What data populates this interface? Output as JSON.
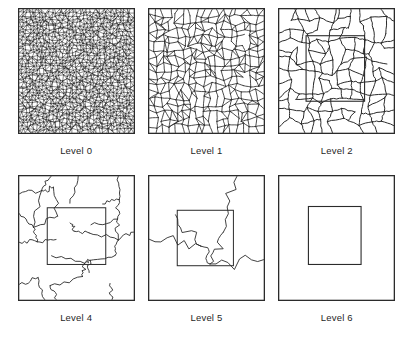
{
  "figure": {
    "type": "multilevel-mesh-coarsening-diagram",
    "background_color": "#ffffff",
    "line_color": "#2b2b2b",
    "label_color": "#1f1f1f",
    "rows": 2,
    "columns": 3,
    "panel_count": 6
  },
  "panels": [
    {
      "id": "level-0",
      "label": "Level 0",
      "row": 0,
      "column": 0,
      "density": 34,
      "jitter": 0.42,
      "edge_width": 0.55,
      "border_width": 1.3,
      "wobble": 0.0,
      "wobble_segments": 1,
      "inner_rect": null,
      "seed": 10701,
      "description": "very dense fine triangular polygonal mesh filling the square"
    },
    {
      "id": "level-1",
      "label": "Level 1",
      "row": 0,
      "column": 1,
      "density": 17,
      "jitter": 0.4,
      "edge_width": 0.85,
      "border_width": 1.3,
      "wobble": 0.035,
      "wobble_segments": 3,
      "inner_rect": null,
      "seed": 22413,
      "description": "medium density polygonal cells, roughly four times coarser than level 0"
    },
    {
      "id": "level-2",
      "label": "Level 2",
      "row": 0,
      "column": 2,
      "density": 11,
      "jitter": 0.46,
      "edge_width": 1.0,
      "border_width": 1.3,
      "wobble": 0.07,
      "wobble_segments": 4,
      "inner_rect": {
        "x": 0.24,
        "y": 0.22,
        "w": 0.5,
        "h": 0.52,
        "width": 1.1
      },
      "seed": 33157,
      "description": "coarse polygonal cells with a faint interior rectangle region outline"
    },
    {
      "id": "level-4",
      "label": "Level 4",
      "row": 1,
      "column": 0,
      "density": 6,
      "jitter": 0.5,
      "edge_width": 0.9,
      "border_width": 1.3,
      "wobble": 0.16,
      "wobble_segments": 7,
      "inner_rect": {
        "x": 0.25,
        "y": 0.26,
        "w": 0.5,
        "h": 0.45,
        "width": 1.0
      },
      "seed": 44029,
      "description": "few large wiggly regions with an interior rectangle outline"
    },
    {
      "id": "level-5",
      "label": "Level 5",
      "row": 1,
      "column": 1,
      "density": 3,
      "jitter": 0.44,
      "edge_width": 0.9,
      "border_width": 1.3,
      "wobble": 0.22,
      "wobble_segments": 9,
      "inner_rect": {
        "x": 0.25,
        "y": 0.28,
        "w": 0.48,
        "h": 0.44,
        "width": 1.0
      },
      "seed": 55771,
      "description": "only a handful of winding boundary curves plus a clear interior rectangle"
    },
    {
      "id": "level-6",
      "label": "Level 6",
      "row": 1,
      "column": 2,
      "density": 0,
      "jitter": 0.0,
      "edge_width": 0.9,
      "border_width": 1.3,
      "wobble": 0.0,
      "wobble_segments": 1,
      "inner_rect": {
        "x": 0.26,
        "y": 0.25,
        "w": 0.45,
        "h": 0.46,
        "width": 1.1
      },
      "seed": 66943,
      "description": "empty square containing only a single nested interior square"
    }
  ],
  "chart_data": {
    "type": "diagram",
    "title": "",
    "series": [
      {
        "name": "Level 0",
        "cells_across": 34,
        "relative_cell_size": 1
      },
      {
        "name": "Level 1",
        "cells_across": 17,
        "relative_cell_size": 2
      },
      {
        "name": "Level 2",
        "cells_across": 11,
        "relative_cell_size": 3
      },
      {
        "name": "Level 4",
        "cells_across": 6,
        "relative_cell_size": 6
      },
      {
        "name": "Level 5",
        "cells_across": 3,
        "relative_cell_size": 11
      },
      {
        "name": "Level 6",
        "cells_across": 0,
        "relative_cell_size": 34
      }
    ],
    "categories": [
      "Level 0",
      "Level 1",
      "Level 2",
      "Level 4",
      "Level 5",
      "Level 6"
    ],
    "xlabel": "",
    "ylabel": "",
    "legend": []
  }
}
